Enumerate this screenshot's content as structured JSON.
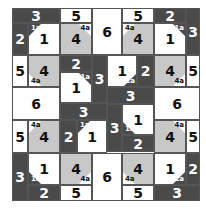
{
  "puzzle": {
    "colors": {
      "dark": "#4a4a4a",
      "gray": "#c8c8c8",
      "white": "#ffffff",
      "border": "#555555"
    },
    "regions": [
      {
        "id": "r1",
        "label": "3",
        "shade": "dark",
        "x": 12,
        "y": 8,
        "w": 48,
        "h": 15
      },
      {
        "id": "r2",
        "label": "5",
        "shade": "white",
        "x": 60,
        "y": 8,
        "w": 32,
        "h": 15
      },
      {
        "id": "r3",
        "label": "6",
        "shade": "white",
        "x": 92,
        "y": 8,
        "w": 30,
        "h": 47
      },
      {
        "id": "r4",
        "label": "5",
        "shade": "white",
        "x": 122,
        "y": 8,
        "w": 32,
        "h": 15
      },
      {
        "id": "r5",
        "label": "2",
        "shade": "dark",
        "x": 154,
        "y": 8,
        "w": 32,
        "h": 15
      },
      {
        "id": "r6",
        "label": "3",
        "shade": "dark",
        "x": 186,
        "y": 8,
        "w": 14,
        "h": 47
      },
      {
        "id": "r7",
        "label": "2",
        "shade": "dark",
        "x": 12,
        "y": 23,
        "w": 16,
        "h": 32
      },
      {
        "id": "r8",
        "label": "1",
        "shade": "white",
        "x": 28,
        "y": 23,
        "w": 32,
        "h": 32,
        "tag": "1a",
        "corner": "tl"
      },
      {
        "id": "r9",
        "label": "4",
        "shade": "gray",
        "x": 60,
        "y": 23,
        "w": 32,
        "h": 32,
        "tag": "4a",
        "corner": "tr"
      },
      {
        "id": "r10",
        "label": "4",
        "shade": "gray",
        "x": 122,
        "y": 23,
        "w": 32,
        "h": 32,
        "tag": "4a",
        "corner": "tl"
      },
      {
        "id": "r11",
        "label": "1",
        "shade": "white",
        "x": 154,
        "y": 23,
        "w": 32,
        "h": 32,
        "tag": "1a",
        "corner": "tr"
      },
      {
        "id": "r12",
        "label": "5",
        "shade": "white",
        "x": 12,
        "y": 55,
        "w": 16,
        "h": 32
      },
      {
        "id": "r13",
        "label": "4",
        "shade": "gray",
        "x": 28,
        "y": 55,
        "w": 32,
        "h": 32,
        "tag": "4a",
        "corner": "bl"
      },
      {
        "id": "r14",
        "label": "2",
        "shade": "dark",
        "x": 60,
        "y": 55,
        "w": 32,
        "h": 17
      },
      {
        "id": "r15",
        "label": "3",
        "shade": "dark",
        "x": 92,
        "y": 55,
        "w": 15,
        "h": 48
      },
      {
        "id": "r16",
        "label": "1",
        "shade": "white",
        "x": 60,
        "y": 72,
        "w": 32,
        "h": 31,
        "tag": "1a",
        "corner": "tr"
      },
      {
        "id": "r17",
        "label": "1",
        "shade": "white",
        "x": 107,
        "y": 55,
        "w": 30,
        "h": 32,
        "tag": "1a",
        "corner": "br"
      },
      {
        "id": "r18",
        "label": "2",
        "shade": "dark",
        "x": 137,
        "y": 55,
        "w": 17,
        "h": 32
      },
      {
        "id": "r19",
        "label": "4",
        "shade": "gray",
        "x": 154,
        "y": 55,
        "w": 32,
        "h": 32,
        "tag": "4a",
        "corner": "br"
      },
      {
        "id": "r20",
        "label": "5",
        "shade": "white",
        "x": 186,
        "y": 55,
        "w": 14,
        "h": 32
      },
      {
        "id": "r21",
        "label": "6",
        "shade": "white",
        "x": 12,
        "y": 87,
        "w": 48,
        "h": 33
      },
      {
        "id": "r22",
        "label": "3",
        "shade": "dark",
        "x": 107,
        "y": 87,
        "w": 47,
        "h": 17
      },
      {
        "id": "r23",
        "label": "6",
        "shade": "white",
        "x": 154,
        "y": 87,
        "w": 46,
        "h": 33
      },
      {
        "id": "r24",
        "label": "3",
        "shade": "dark",
        "x": 60,
        "y": 103,
        "w": 47,
        "h": 17
      },
      {
        "id": "r25",
        "label": "3",
        "shade": "dark",
        "x": 107,
        "y": 104,
        "w": 15,
        "h": 48
      },
      {
        "id": "r26",
        "label": "1",
        "shade": "white",
        "x": 122,
        "y": 104,
        "w": 32,
        "h": 31,
        "tag": "1a",
        "corner": "bl"
      },
      {
        "id": "r27",
        "label": "2",
        "shade": "dark",
        "x": 122,
        "y": 135,
        "w": 32,
        "h": 17
      },
      {
        "id": "r28",
        "label": "5",
        "shade": "white",
        "x": 12,
        "y": 120,
        "w": 16,
        "h": 33
      },
      {
        "id": "r29",
        "label": "4",
        "shade": "gray",
        "x": 28,
        "y": 120,
        "w": 32,
        "h": 33,
        "tag": "4a",
        "corner": "tl"
      },
      {
        "id": "r30",
        "label": "2",
        "shade": "dark",
        "x": 60,
        "y": 120,
        "w": 17,
        "h": 33
      },
      {
        "id": "r31",
        "label": "1",
        "shade": "white",
        "x": 77,
        "y": 120,
        "w": 30,
        "h": 33,
        "tag": "1a",
        "corner": "tl"
      },
      {
        "id": "r32",
        "label": "4",
        "shade": "gray",
        "x": 154,
        "y": 120,
        "w": 32,
        "h": 33,
        "tag": "4a",
        "corner": "tr"
      },
      {
        "id": "r33",
        "label": "5",
        "shade": "white",
        "x": 186,
        "y": 120,
        "w": 14,
        "h": 33
      },
      {
        "id": "r34",
        "label": "3",
        "shade": "dark",
        "x": 12,
        "y": 153,
        "w": 16,
        "h": 48
      },
      {
        "id": "r35",
        "label": "1",
        "shade": "white",
        "x": 28,
        "y": 153,
        "w": 32,
        "h": 32,
        "tag": "1a",
        "corner": "bl"
      },
      {
        "id": "r36",
        "label": "4",
        "shade": "gray",
        "x": 60,
        "y": 153,
        "w": 32,
        "h": 32,
        "tag": "4a",
        "corner": "br"
      },
      {
        "id": "r37",
        "label": "6",
        "shade": "white",
        "x": 92,
        "y": 153,
        "w": 30,
        "h": 48
      },
      {
        "id": "r38",
        "label": "4",
        "shade": "gray",
        "x": 122,
        "y": 153,
        "w": 32,
        "h": 32,
        "tag": "4a",
        "corner": "bl"
      },
      {
        "id": "r39",
        "label": "1",
        "shade": "white",
        "x": 154,
        "y": 153,
        "w": 32,
        "h": 32,
        "tag": "1a",
        "corner": "br"
      },
      {
        "id": "r40",
        "label": "2",
        "shade": "dark",
        "x": 186,
        "y": 153,
        "w": 14,
        "h": 32
      },
      {
        "id": "r41",
        "label": "2",
        "shade": "dark",
        "x": 28,
        "y": 185,
        "w": 32,
        "h": 16
      },
      {
        "id": "r42",
        "label": "5",
        "shade": "white",
        "x": 60,
        "y": 185,
        "w": 32,
        "h": 16
      },
      {
        "id": "r43",
        "label": "5",
        "shade": "white",
        "x": 122,
        "y": 185,
        "w": 32,
        "h": 16
      },
      {
        "id": "r44",
        "label": "3",
        "shade": "dark",
        "x": 154,
        "y": 185,
        "w": 46,
        "h": 16
      }
    ]
  }
}
